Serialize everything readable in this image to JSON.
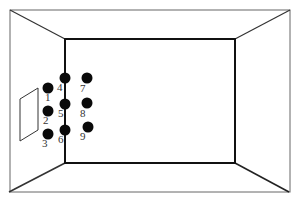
{
  "diagram": {
    "type": "room-perspective",
    "colors": {
      "line": "#222222",
      "thin_line": "#555555",
      "dot": "#0a0a0a",
      "background": "#ffffff"
    },
    "outer_frame": {
      "x1": 10,
      "y1": 10,
      "x2": 290,
      "y2": 192
    },
    "back_wall": {
      "x1": 65,
      "y1": 39,
      "x2": 235,
      "y2": 163
    },
    "side_panel": {
      "points": "20,99 38,88 38,130 20,141"
    },
    "dots": [
      {
        "id": "1",
        "label": "1",
        "cx": 48,
        "cy": 88,
        "lx": 45,
        "ly": 101
      },
      {
        "id": "2",
        "label": "2",
        "cx": 48,
        "cy": 111,
        "lx": 43,
        "ly": 124
      },
      {
        "id": "3",
        "label": "3",
        "cx": 48,
        "cy": 134,
        "lx": 42,
        "ly": 147
      },
      {
        "id": "4",
        "label": "4",
        "cx": 65,
        "cy": 78,
        "lx": 57,
        "ly": 91
      },
      {
        "id": "5",
        "label": "5",
        "cx": 65,
        "cy": 104,
        "lx": 58,
        "ly": 117
      },
      {
        "id": "6",
        "label": "6",
        "cx": 65,
        "cy": 130,
        "lx": 58,
        "ly": 143
      },
      {
        "id": "7",
        "label": "7",
        "cx": 87,
        "cy": 78,
        "lx": 80,
        "ly": 92
      },
      {
        "id": "8",
        "label": "8",
        "cx": 87,
        "cy": 103,
        "lx": 80,
        "ly": 117
      },
      {
        "id": "9",
        "label": "9",
        "cx": 88,
        "cy": 127,
        "lx": 80,
        "ly": 140
      }
    ]
  }
}
